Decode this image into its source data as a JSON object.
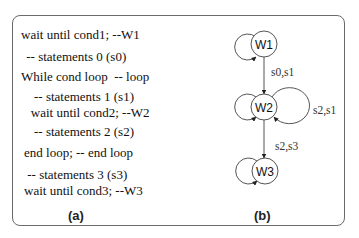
{
  "panel_a": {
    "caption": "(a)",
    "code_lines": [
      "wait until cond1; --W1",
      " -- statements 0 (s0)",
      "While cond loop  -- loop",
      "    -- statements 1 (s1)",
      "   wait until cond2; --W2",
      "    -- statements 2 (s2)",
      "end loop; -- end loop",
      " -- statements 3 (s3)",
      "wait until cond3; --W3"
    ]
  },
  "panel_b": {
    "caption": "(b)",
    "nodes": [
      "W1",
      "W2",
      "W3"
    ],
    "edges": [
      {
        "from": "W1",
        "to": "W2",
        "label": "s0,s1"
      },
      {
        "from": "W2",
        "to": "W2",
        "label": "s2,s1"
      },
      {
        "from": "W2",
        "to": "W3",
        "label": "s2,s3"
      }
    ]
  },
  "colors": {
    "stroke": "#555555",
    "text": "#111111",
    "border": "#6a6a6a"
  }
}
